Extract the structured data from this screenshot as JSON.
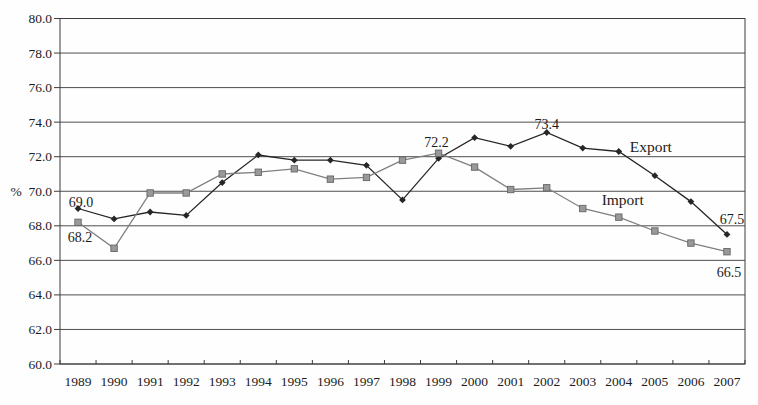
{
  "chart_data": {
    "type": "line",
    "title": "",
    "ylabel": "%",
    "xlabel": "",
    "ylim": [
      60.0,
      80.0
    ],
    "ytick_step": 2.0,
    "grid": "horizontal",
    "legend_position": "inline-labels",
    "categories": [
      "1989",
      "1990",
      "1991",
      "1992",
      "1993",
      "1994",
      "1995",
      "1996",
      "1997",
      "1998",
      "1999",
      "2000",
      "2001",
      "2002",
      "2003",
      "2004",
      "2005",
      "2006",
      "2007"
    ],
    "yticks": [
      "80.0",
      "78.0",
      "76.0",
      "74.0",
      "72.0",
      "70.0",
      "68.0",
      "66.0",
      "64.0",
      "62.0",
      "60.0"
    ],
    "series": [
      {
        "name": "Export",
        "marker": "diamond",
        "color": "#262626",
        "values": [
          69.0,
          68.4,
          68.8,
          68.6,
          70.5,
          72.1,
          71.8,
          71.8,
          71.5,
          69.5,
          71.9,
          73.1,
          72.6,
          73.4,
          72.5,
          72.3,
          70.9,
          69.4,
          67.5
        ]
      },
      {
        "name": "Import",
        "marker": "square",
        "color": "#888888",
        "values": [
          68.2,
          66.7,
          69.9,
          69.9,
          71.0,
          71.1,
          71.3,
          70.7,
          70.8,
          71.8,
          72.2,
          71.4,
          70.1,
          70.2,
          69.0,
          68.5,
          67.7,
          67.0,
          66.5
        ]
      }
    ],
    "annotations": [
      {
        "kind": "value",
        "text": "69.0",
        "year": "1989",
        "value": 69.0,
        "dx": 3,
        "dy": -6
      },
      {
        "kind": "value",
        "text": "68.2",
        "year": "1989",
        "value": 68.2,
        "dx": 2,
        "dy": 15
      },
      {
        "kind": "value",
        "text": "72.2",
        "year": "1999",
        "value": 72.2,
        "dx": -2,
        "dy": -11
      },
      {
        "kind": "value",
        "text": "73.4",
        "year": "2002",
        "value": 73.4,
        "dx": 0,
        "dy": -8
      },
      {
        "kind": "series",
        "text": "Export",
        "year": "2004",
        "value": 72.3,
        "dx": 32,
        "dy": -4
      },
      {
        "kind": "series",
        "text": "Import",
        "year": "2003",
        "value": 69.0,
        "dx": 40,
        "dy": -8
      },
      {
        "kind": "value",
        "text": "67.5",
        "year": "2007",
        "value": 67.5,
        "dx": 5,
        "dy": -15
      },
      {
        "kind": "value",
        "text": "66.5",
        "year": "2007",
        "value": 66.5,
        "dx": 2,
        "dy": 20
      }
    ]
  },
  "colors": {
    "background": "#fefefe",
    "gridline": "#4d4d4d",
    "plot_border": "#3c3c3c",
    "axis_text": "#1c1c1c",
    "export_line": "#262626",
    "import_line": "#7f7f7f",
    "import_marker_fill": "#999999",
    "import_marker_edge": "#666666"
  }
}
